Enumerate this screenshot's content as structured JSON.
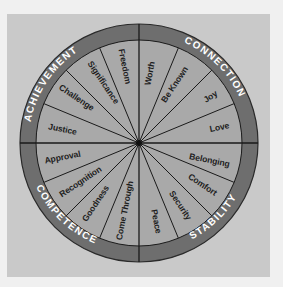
{
  "diagram": {
    "type": "wheel",
    "center": [
      139,
      143
    ],
    "colors": {
      "page_bg": "#f0f0f0",
      "panel_bg": "#c9c9c9",
      "ring": "#6e6e6e",
      "wedge_fill": "#a9a9a9",
      "line": "#1a1a1a",
      "wedge_text": "#1e1e1e",
      "ring_text": "#ffffff"
    },
    "categories": [
      {
        "label": "ACHIEVEMENT",
        "quadrant": "top-left"
      },
      {
        "label": "CONNECTION",
        "quadrant": "top-right"
      },
      {
        "label": "STABILITY",
        "quadrant": "bottom-right"
      },
      {
        "label": "COMPETENCE",
        "quadrant": "bottom-left"
      }
    ],
    "wedges": [
      {
        "label": "Worth",
        "category": "CONNECTION"
      },
      {
        "label": "Be Known",
        "category": "CONNECTION"
      },
      {
        "label": "Joy",
        "category": "CONNECTION"
      },
      {
        "label": "Love",
        "category": "CONNECTION"
      },
      {
        "label": "Belonging",
        "category": "STABILITY"
      },
      {
        "label": "Comfort",
        "category": "STABILITY"
      },
      {
        "label": "Security",
        "category": "STABILITY"
      },
      {
        "label": "Peace",
        "category": "STABILITY"
      },
      {
        "label": "Come Through",
        "category": "COMPETENCE"
      },
      {
        "label": "Goodness",
        "category": "COMPETENCE"
      },
      {
        "label": "Recognition",
        "category": "COMPETENCE"
      },
      {
        "label": "Approval",
        "category": "COMPETENCE"
      },
      {
        "label": "Justice",
        "category": "ACHIEVEMENT"
      },
      {
        "label": "Challenge",
        "category": "ACHIEVEMENT"
      },
      {
        "label": "Significance",
        "category": "ACHIEVEMENT"
      },
      {
        "label": "Freedom",
        "category": "ACHIEVEMENT"
      }
    ]
  }
}
